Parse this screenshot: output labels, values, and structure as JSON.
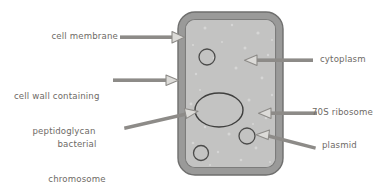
{
  "diagram": {
    "colors": {
      "background": "#ffffff",
      "cell_wall": "#9a9a99",
      "cell_wall_outline": "#6f6f6e",
      "cytoplasm": "#c3c3c2",
      "membrane_line": "#7c7c7b",
      "organelle_outline": "#4b4b4a",
      "arrow": "#8d8b88",
      "arrow_head_fill": "#dcdbd8",
      "text": "#6e6a66"
    },
    "labels": [
      {
        "id": "cell-membrane",
        "text": "cell membrane",
        "lines": [
          "cell membrane"
        ]
      },
      {
        "id": "cell-wall",
        "text": "cell wall containing peptidoglycan",
        "lines": [
          "cell wall containing",
          "peptidoglycan"
        ]
      },
      {
        "id": "bacterial-chromosome",
        "text": "bacterial chromosome",
        "lines": [
          "bacterial",
          "chromosome"
        ]
      },
      {
        "id": "cytoplasm",
        "text": "cytoplasm",
        "lines": [
          "cytoplasm"
        ]
      },
      {
        "id": "ribosome",
        "text": "70S ribosome",
        "lines": [
          "70S ribosome"
        ]
      },
      {
        "id": "plasmid",
        "text": "plasmid",
        "lines": [
          "plasmid"
        ]
      }
    ],
    "structures": [
      {
        "id": "cell-wall-body",
        "name": "cell wall"
      },
      {
        "id": "cell-membrane-line",
        "name": "cell membrane"
      },
      {
        "id": "cytoplasm-area",
        "name": "cytoplasm"
      },
      {
        "id": "bacterial-chromosome-shape",
        "name": "bacterial chromosome"
      },
      {
        "id": "ribosome-1",
        "name": "70S ribosome"
      },
      {
        "id": "ribosome-2",
        "name": "70S ribosome"
      },
      {
        "id": "plasmid-shape",
        "name": "plasmid"
      }
    ]
  }
}
